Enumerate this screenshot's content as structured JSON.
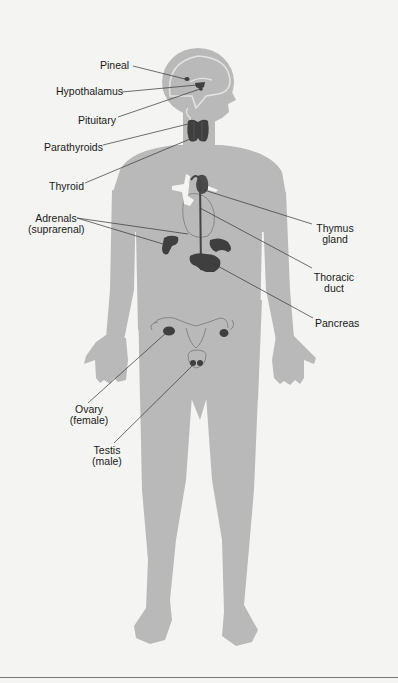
{
  "colors": {
    "body": "#b9b9b9",
    "organ": "#3f3f3f",
    "leader": "#333333",
    "background": "#f4f4f2",
    "brain_outline": "#e6e6e6"
  },
  "labels": {
    "pineal": "Pineal",
    "hypothalamus": "Hypothalamus",
    "pituitary": "Pituitary",
    "parathyroids": "Parathyroids",
    "thyroid": "Thyroid",
    "adrenals_1": "Adrenals",
    "adrenals_2": "(suprarenal)",
    "thymus_1": "Thymus",
    "thymus_2": "gland",
    "thoracic_1": "Thoracic",
    "thoracic_2": "duct",
    "pancreas": "Pancreas",
    "ovary_1": "Ovary",
    "ovary_2": "(female)",
    "testis_1": "Testis",
    "testis_2": "(male)"
  }
}
